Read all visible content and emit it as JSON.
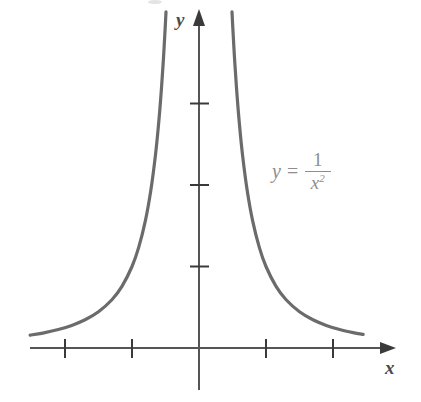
{
  "figure": {
    "kind": "math-graph",
    "background_color": "#ffffff",
    "axis_color": "#555555",
    "curve_color": "#6b6b6b",
    "label_color": "#4a4a4a",
    "equation_color": "#8e8e8e"
  },
  "labels": {
    "y_axis": "y",
    "x_axis": "x"
  },
  "equation": {
    "lhs": "y",
    "operator": "=",
    "numerator": "1",
    "denominator_base": "x",
    "denominator_exponent": "2",
    "plain": "y = 1/x^2"
  },
  "chart_data": {
    "type": "line",
    "title": "",
    "subtitle": "",
    "xlabel": "x",
    "ylabel": "y",
    "annotations": [
      {
        "text": "y = 1/x^2",
        "x_px": 272,
        "y_px": 150
      }
    ],
    "legend": [],
    "legend_position": "none",
    "grid": false,
    "axis_style": "arrow-terminated cartesian axes through origin",
    "xlim": [
      -2.52,
      2.93
    ],
    "ylim": [
      -0.52,
      4.12
    ],
    "xtick_values": [
      -2,
      -1,
      1,
      2
    ],
    "ytick_values": [
      1,
      2,
      3
    ],
    "xtick_labels": [
      "",
      "",
      "",
      ""
    ],
    "ytick_labels": [
      "",
      "",
      ""
    ],
    "origin_px": [
      199,
      348
    ],
    "x_unit_px": 67,
    "y_unit_px": 81.5,
    "series": [
      {
        "name": "y = 1/x^2 (left branch)",
        "x": [
          -2.52,
          -2.3,
          -2.1,
          -1.9,
          -1.7,
          -1.5,
          -1.3,
          -1.15,
          -1.0,
          -0.9,
          -0.8,
          -0.72,
          -0.65,
          -0.6,
          -0.56,
          -0.53,
          -0.505,
          -0.4925
        ],
        "y": [
          0.1575,
          0.189,
          0.2268,
          0.277,
          0.346,
          0.4444,
          0.5917,
          0.756,
          1.0,
          1.2346,
          1.5625,
          1.929,
          2.367,
          2.778,
          3.189,
          3.56,
          3.922,
          4.124
        ]
      },
      {
        "name": "y = 1/x^2 (right branch)",
        "x": [
          0.4925,
          0.505,
          0.53,
          0.56,
          0.6,
          0.65,
          0.72,
          0.8,
          0.9,
          1.0,
          1.15,
          1.3,
          1.5,
          1.7,
          1.9,
          2.1,
          2.3,
          2.45
        ],
        "y": [
          4.124,
          3.922,
          3.56,
          3.189,
          2.778,
          2.367,
          1.929,
          1.5625,
          1.2346,
          1.0,
          0.756,
          0.5917,
          0.4444,
          0.346,
          0.277,
          0.2268,
          0.189,
          0.1666
        ]
      }
    ]
  }
}
